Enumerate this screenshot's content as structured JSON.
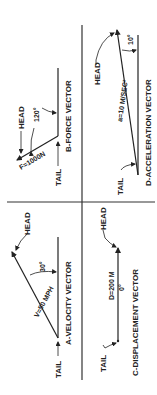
{
  "colors": {
    "ink": "#222222",
    "background": "#ffffff"
  },
  "diagram": {
    "orientation": "rotated 90 degrees counter-clockwise",
    "panels": [
      {
        "id": "A",
        "title": "A-VELOCITY VECTOR",
        "magnitude_label": "V=50 MPH",
        "angle_label": "30°",
        "head_label": "HEAD",
        "tail_label": "TAIL"
      },
      {
        "id": "B",
        "title": "B-FORCE VECTOR",
        "magnitude_label": "F=1000N",
        "angle_label": "120°",
        "head_label": "HEAD",
        "tail_label": "TAIL"
      },
      {
        "id": "C",
        "title": "C-DISPLACEMENT VECTOR",
        "magnitude_label": "D=200 M",
        "angle_label": "0°",
        "head_label": "HEAD",
        "tail_label": "TAIL"
      },
      {
        "id": "D",
        "title": "D-ACCELERATION VECTOR",
        "magnitude_label": "a=10 M/SEC²",
        "angle_label": "10°",
        "head_label": "HEAD",
        "tail_label": "TAIL"
      }
    ]
  }
}
